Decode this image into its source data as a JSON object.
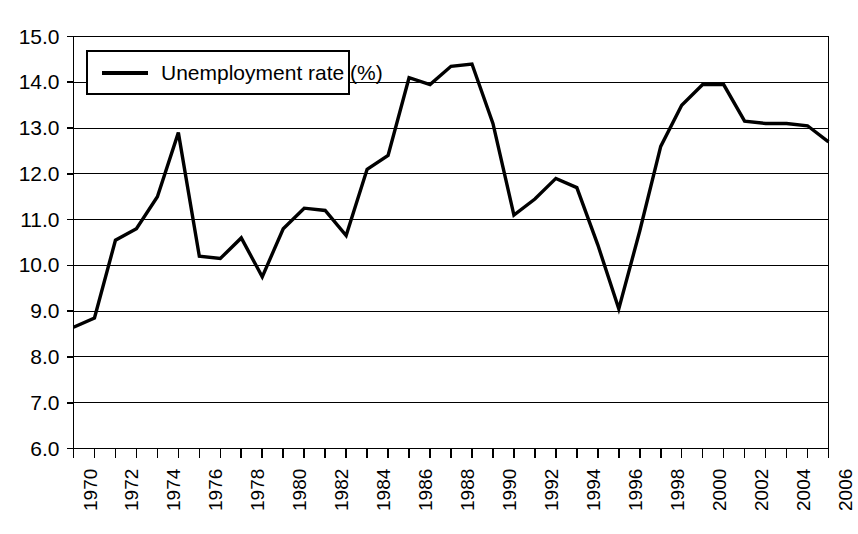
{
  "chart_data": {
    "type": "line",
    "title": "",
    "xlabel": "",
    "ylabel": "",
    "xlim": [
      1970,
      2006
    ],
    "ylim": [
      6.0,
      15.0
    ],
    "grid": true,
    "legend_position": "top-left",
    "series": [
      {
        "name": "Unemployment rate (%)",
        "color": "#000000",
        "x": [
          1970,
          1971,
          1972,
          1973,
          1974,
          1975,
          1976,
          1977,
          1978,
          1979,
          1980,
          1981,
          1982,
          1983,
          1984,
          1985,
          1986,
          1987,
          1988,
          1989,
          1990,
          1991,
          1992,
          1993,
          1994,
          1995,
          1996,
          1997,
          1998,
          1999,
          2000,
          2001,
          2002,
          2003,
          2004,
          2005,
          2006
        ],
        "values": [
          8.65,
          8.85,
          10.55,
          10.8,
          11.5,
          12.9,
          10.2,
          10.15,
          10.6,
          9.75,
          10.8,
          11.25,
          11.2,
          10.65,
          12.1,
          12.4,
          14.1,
          13.95,
          14.35,
          14.4,
          13.1,
          11.1,
          11.45,
          11.9,
          11.7,
          10.45,
          9.05,
          10.75,
          12.6,
          13.5,
          13.95,
          13.95,
          13.15,
          13.1,
          13.1,
          13.05,
          12.7
        ]
      }
    ],
    "y_ticks": [
      "15.0",
      "14.0",
      "13.0",
      "12.0",
      "11.0",
      "10.0",
      "9.0",
      "8.0",
      "7.0",
      "6.0"
    ],
    "y_tick_values": [
      15.0,
      14.0,
      13.0,
      12.0,
      11.0,
      10.0,
      9.0,
      8.0,
      7.0,
      6.0
    ],
    "x_tick_labels": [
      "1970",
      "1972",
      "1974",
      "1976",
      "1978",
      "1980",
      "1982",
      "1984",
      "1986",
      "1988",
      "1990",
      "1992",
      "1994",
      "1996",
      "1998",
      "2000",
      "2002",
      "2004",
      "2006"
    ],
    "x_tick_values": [
      1970,
      1972,
      1974,
      1976,
      1978,
      1980,
      1982,
      1984,
      1986,
      1988,
      1990,
      1992,
      1994,
      1996,
      1998,
      2000,
      2002,
      2004,
      2006
    ],
    "x_minor_values": [
      1971,
      1973,
      1975,
      1977,
      1979,
      1981,
      1983,
      1985,
      1987,
      1989,
      1991,
      1993,
      1995,
      1997,
      1999,
      2001,
      2003,
      2005
    ]
  },
  "legend": {
    "entry_label": "Unemployment rate (%)"
  }
}
